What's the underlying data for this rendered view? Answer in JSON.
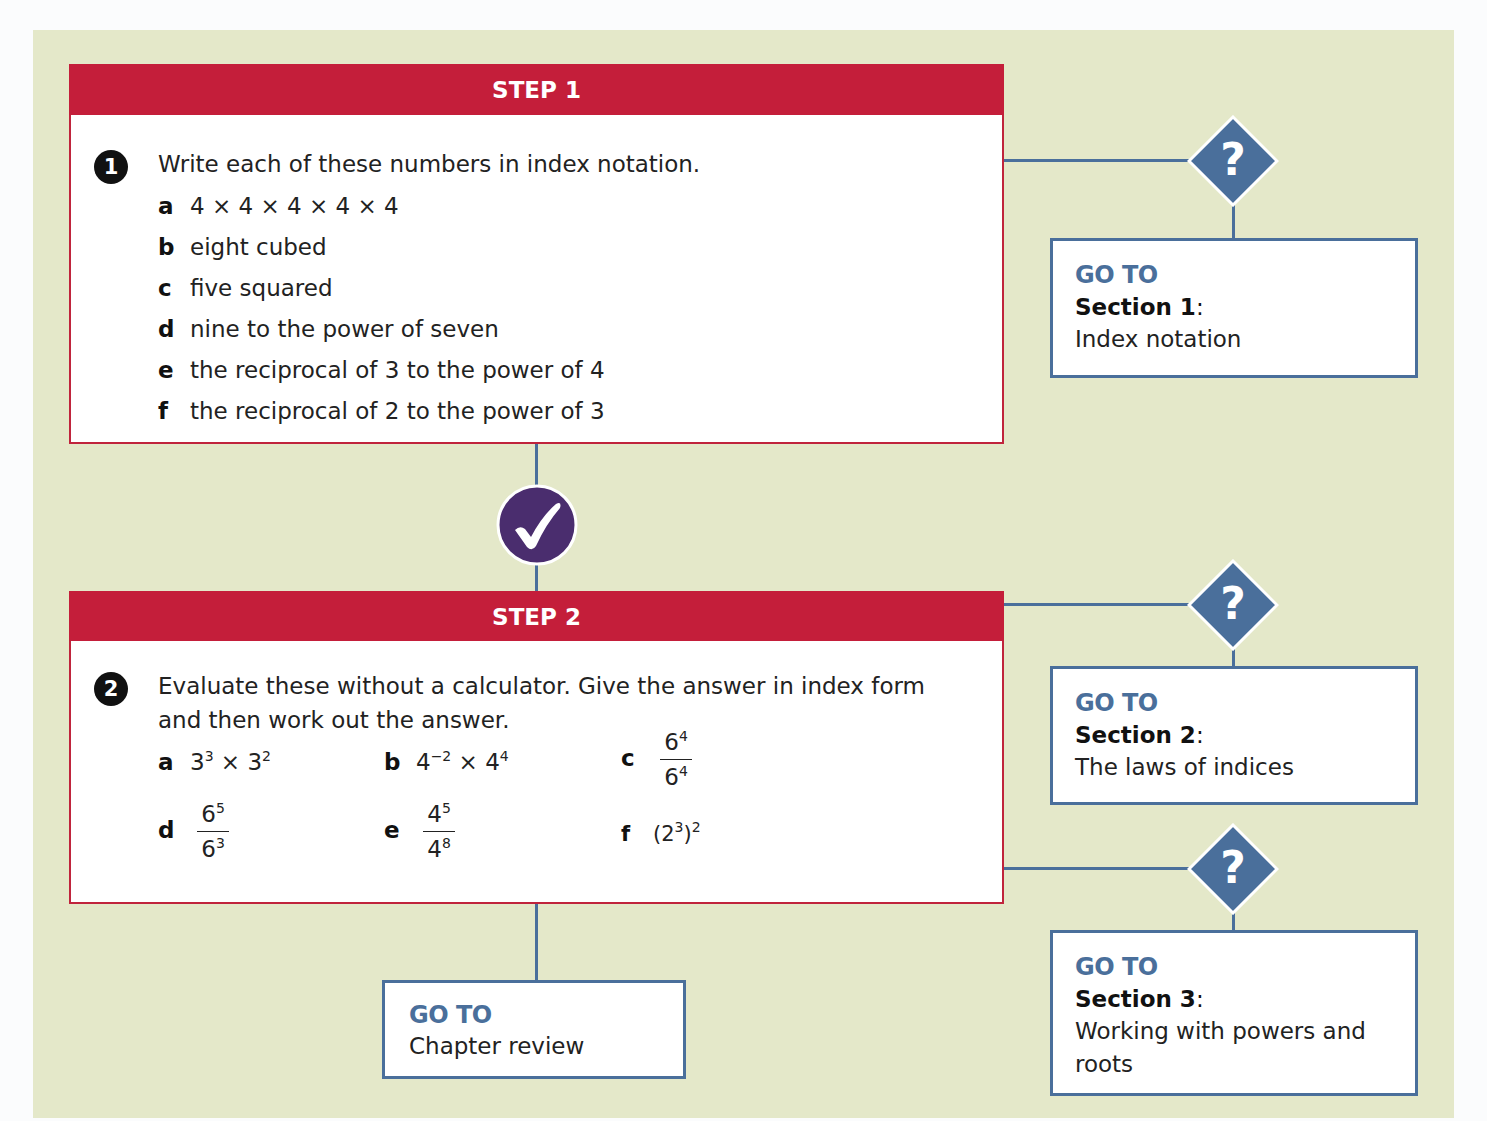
{
  "step1": {
    "header": "STEP 1",
    "question_number": "1",
    "prompt": "Write each of these numbers in index notation.",
    "items": [
      {
        "letter": "a",
        "text": "4 × 4 × 4 × 4 × 4"
      },
      {
        "letter": "b",
        "text": "eight cubed"
      },
      {
        "letter": "c",
        "text": "five squared"
      },
      {
        "letter": "d",
        "text": "nine to the power of seven"
      },
      {
        "letter": "e",
        "text": "the reciprocal of 3 to the power of 4"
      },
      {
        "letter": "f",
        "text": "the reciprocal of 2 to the power of 3"
      }
    ]
  },
  "step2": {
    "header": "STEP 2",
    "question_number": "2",
    "prompt_line1": "Evaluate these without a calculator. Give the answer in index form",
    "prompt_line2": "and then work out the answer.",
    "items": {
      "a": {
        "letter": "a",
        "base1": "3",
        "exp1": "3",
        "op": " × ",
        "base2": "3",
        "exp2": "2"
      },
      "b": {
        "letter": "b",
        "base1": "4",
        "exp1": "−2",
        "op": " × ",
        "base2": "4",
        "exp2": "4"
      },
      "c": {
        "letter": "c",
        "num_base": "6",
        "num_exp": "4",
        "den_base": "6",
        "den_exp": "4"
      },
      "d": {
        "letter": "d",
        "num_base": "6",
        "num_exp": "5",
        "den_base": "6",
        "den_exp": "3"
      },
      "e": {
        "letter": "e",
        "num_base": "4",
        "num_exp": "5",
        "den_base": "4",
        "den_exp": "8"
      },
      "f": {
        "letter": "f",
        "open": "(2",
        "inner_exp": "3",
        "close": ")",
        "outer_exp": "2"
      }
    }
  },
  "goto_boxes": [
    {
      "label": "GO TO",
      "section": "Section 1",
      "colon": ":",
      "title": "Index notation"
    },
    {
      "label": "GO TO",
      "section": "Section 2",
      "colon": ":",
      "title": "The laws of indices"
    },
    {
      "label": "GO TO",
      "section": "Section 3",
      "colon": ":",
      "title_line1": "Working with powers and",
      "title_line2": "roots"
    }
  ],
  "chapter_review": {
    "label": "GO TO",
    "title": "Chapter review"
  },
  "icons": {
    "decision": "question-diamond-icon",
    "pass": "checkmark-circle-icon"
  },
  "colors": {
    "background_panel": "#e4e8c9",
    "step_header": "#c41e3a",
    "connector_blue": "#4a6f9b",
    "check_purple": "#4a2d6e"
  }
}
